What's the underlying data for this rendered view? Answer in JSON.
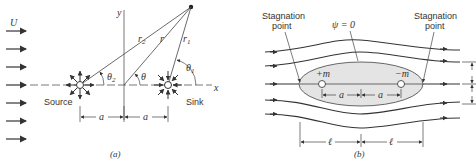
{
  "panel_a": {
    "caption": "(a)",
    "uniform_flow_label": "U",
    "source_label": "Source",
    "sink_label": "Sink",
    "axis_x_label": "x",
    "axis_y_label": "y",
    "r_label": "r",
    "r1_label": "r",
    "r1_sub": "1",
    "r2_label": "r",
    "r2_sub": "2",
    "theta_label": "θ",
    "theta1_label": "θ",
    "theta1_sub": "1",
    "theta2_label": "θ",
    "theta2_sub": "2",
    "dim_left": "a",
    "dim_right": "a"
  },
  "panel_b": {
    "caption": "(b)",
    "stagnation_left_line1": "Stagnation",
    "stagnation_left_line2": "point",
    "stagnation_right_line1": "Stagnation",
    "stagnation_right_line2": "point",
    "psi_label": "ψ = 0",
    "source_label": "+m",
    "sink_label": "−m",
    "dim_a_left": "a",
    "dim_a_right": "a",
    "dim_l_left": "ℓ",
    "dim_l_right": "ℓ",
    "body_fill": "#e4e4e4"
  }
}
